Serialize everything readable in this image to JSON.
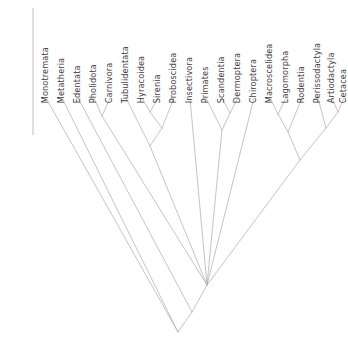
{
  "figure": {
    "type": "phylogenetic-cladogram",
    "orientation": "tips-top-root-bottom",
    "line_color": "#b0b0b0",
    "label_color": "#3d3d3d",
    "background_color": "#ffffff",
    "axis_line": {
      "name": "left-vertical-axis",
      "x": 33,
      "y_top": 8,
      "y_bottom": 135,
      "color": "#b0b0b0"
    }
  },
  "taxa": [
    {
      "label": "Monotremata",
      "x": 46,
      "tip_y": 98
    },
    {
      "label": "Metatheria",
      "x": 62,
      "tip_y": 98
    },
    {
      "label": "Edentata",
      "x": 78,
      "tip_y": 98
    },
    {
      "label": "Pholidota",
      "x": 94,
      "tip_y": 98
    },
    {
      "label": "Carnivora",
      "x": 110,
      "tip_y": 98
    },
    {
      "label": "Tubulidentata",
      "x": 126,
      "tip_y": 98
    },
    {
      "label": "Hyracoidea",
      "x": 142,
      "tip_y": 98
    },
    {
      "label": "Sirenia",
      "x": 158,
      "tip_y": 98
    },
    {
      "label": "Proboscidea",
      "x": 174,
      "tip_y": 98
    },
    {
      "label": "Insectivora",
      "x": 190,
      "tip_y": 98
    },
    {
      "label": "Primates",
      "x": 206,
      "tip_y": 98
    },
    {
      "label": "Scandentia",
      "x": 222,
      "tip_y": 98
    },
    {
      "label": "Dermoptera",
      "x": 238,
      "tip_y": 98
    },
    {
      "label": "Chiroptera",
      "x": 254,
      "tip_y": 98
    },
    {
      "label": "Macroscelidea",
      "x": 270,
      "tip_y": 98
    },
    {
      "label": "Lagomorpha",
      "x": 286,
      "tip_y": 98
    },
    {
      "label": "Rodentia",
      "x": 302,
      "tip_y": 98
    },
    {
      "label": "Perissodactyla",
      "x": 318,
      "tip_y": 98
    },
    {
      "label": "Artiodactyla",
      "x": 332,
      "tip_y": 98
    },
    {
      "label": "Cetacea",
      "x": 344,
      "tip_y": 98
    }
  ],
  "label_baseline_y": 95,
  "chart_data": {
    "type": "cladogram",
    "title": "",
    "n_taxa": 20,
    "tip_labels": [
      "Monotremata",
      "Metatheria",
      "Edentata",
      "Pholidota",
      "Carnivora",
      "Tubulidentata",
      "Hyracoidea",
      "Sirenia",
      "Proboscidea",
      "Insectivora",
      "Primates",
      "Scandentia",
      "Dermoptera",
      "Chiroptera",
      "Macroscelidea",
      "Lagomorpha",
      "Rodentia",
      "Perissodactyla",
      "Artiodactyla",
      "Cetacea"
    ],
    "internal_nodes": [
      {
        "id": "n_phol_carn",
        "x": 102,
        "y": 116,
        "children": [
          "Pholidota",
          "Carnivora"
        ]
      },
      {
        "id": "n_hyrac_siren",
        "x": 150,
        "y": 112,
        "children": [
          "Hyracoidea",
          "Sirenia"
        ]
      },
      {
        "id": "n_paenungulata",
        "x": 162,
        "y": 128,
        "children": [
          "n_hyrac_siren",
          "Proboscidea"
        ]
      },
      {
        "id": "n_tubul_paenu",
        "x": 150,
        "y": 146,
        "children": [
          "Tubulidentata",
          "n_paenungulata"
        ]
      },
      {
        "id": "n_scand_dermo",
        "x": 230,
        "y": 113,
        "children": [
          "Scandentia",
          "Dermoptera"
        ]
      },
      {
        "id": "n_prim_scand",
        "x": 222,
        "y": 130,
        "children": [
          "Primates",
          "n_scand_dermo"
        ]
      },
      {
        "id": "n_macro_lago",
        "x": 278,
        "y": 114,
        "children": [
          "Macroscelidea",
          "Lagomorpha"
        ]
      },
      {
        "id": "n_glires",
        "x": 288,
        "y": 132,
        "children": [
          "n_macro_lago",
          "Rodentia"
        ]
      },
      {
        "id": "n_arti_cet",
        "x": 338,
        "y": 112,
        "children": [
          "Artiodactyla",
          "Cetacea"
        ]
      },
      {
        "id": "n_peris_artcet",
        "x": 326,
        "y": 128,
        "children": [
          "Perissodactyla",
          "n_arti_cet"
        ]
      },
      {
        "id": "n_laurasia_right",
        "x": 300,
        "y": 160,
        "children": [
          "n_glires",
          "n_peris_artcet"
        ]
      },
      {
        "id": "n_polytomy_root",
        "x": 207,
        "y": 285,
        "children": [
          "n_phol_carn",
          "n_tubul_paenu",
          "Insectivora",
          "n_prim_scand",
          "Chiroptera",
          "n_laurasia_right"
        ]
      },
      {
        "id": "n_theria",
        "x": 192,
        "y": 312,
        "children": [
          "Edentata",
          "n_polytomy_root"
        ]
      },
      {
        "id": "n_mammalia",
        "x": 178,
        "y": 332,
        "children": [
          "Metatheria",
          "n_theria"
        ]
      },
      {
        "id": "n_base",
        "x": 178,
        "y": 332,
        "children": [
          "Monotremata",
          "n_mammalia"
        ]
      }
    ],
    "xlabel": "",
    "ylabel": "",
    "grid": false,
    "legend": "none"
  }
}
